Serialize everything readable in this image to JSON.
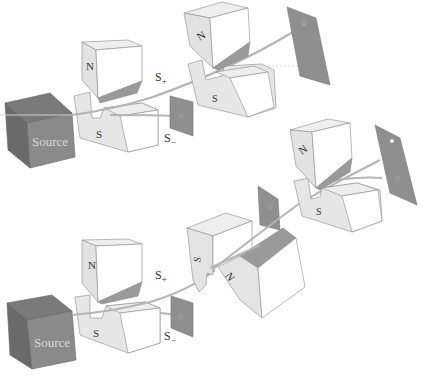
{
  "diagram": {
    "colors": {
      "source_front": "#8a8a8a",
      "source_top": "#777777",
      "source_side": "#6a6a6a",
      "magnet_light": "#e6e6e6",
      "magnet_white": "#ffffff",
      "magnet_shade": "#9a9a9a",
      "screen": "#8f8f8f",
      "beam": "#b5b5b5",
      "edge": "#8c8c8c"
    },
    "top_setup": {
      "source_label": "Source",
      "magnet1": {
        "north_label": "N",
        "south_label": "S"
      },
      "beam_up_label": "S",
      "beam_up_sub": "+",
      "beam_down_label": "S",
      "beam_down_sub": "−",
      "magnet2": {
        "north_label": "N",
        "south_label": "S"
      }
    },
    "bottom_setup": {
      "source_label": "Source",
      "magnet1": {
        "north_label": "N",
        "south_label": "S"
      },
      "beam_up_label": "S",
      "beam_up_sub": "+",
      "beam_down_label": "S",
      "beam_down_sub": "−",
      "magnet2_rotated": {
        "north_label": "N",
        "south_label": "S"
      },
      "magnet3": {
        "north_label": "N",
        "south_label": "S"
      }
    }
  }
}
